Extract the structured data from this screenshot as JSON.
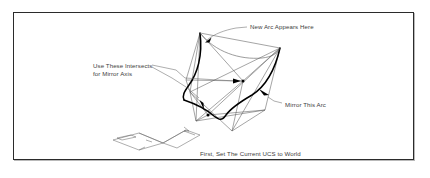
{
  "figure": {
    "type": "technical-line-drawing",
    "frame_color": "#2b2b2b",
    "background_color": "#ffffff",
    "line_color": "#555555",
    "bold_line_color": "#000000",
    "text_color": "#3d3d3d"
  },
  "labels": {
    "new_arc": "New Arc Appears Here",
    "intersects_line1": "Use These Intersects",
    "intersects_line2": "for Mirror Axis",
    "mirror_arc": "Mirror This Arc",
    "caption": "First, Set The Current UCS to World"
  },
  "annotations": {
    "leader_count": 4,
    "intersection_points": 2,
    "bold_arcs": 2
  }
}
